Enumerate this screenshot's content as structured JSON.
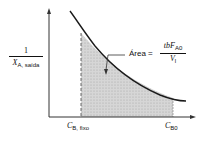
{
  "diagram": {
    "y_axis_label": {
      "numerator": "1",
      "denominator_var": "X",
      "denominator_sub": "A, saída"
    },
    "x_axis_ticks": [
      {
        "var": "C",
        "sub": "B, fixo"
      },
      {
        "var": "C",
        "sub": "B0"
      }
    ],
    "area_annotation": {
      "label": "Área =",
      "numerator_prefix": "tbF",
      "numerator_sub": "A0",
      "denominator_var": "V",
      "denominator_sub": "l"
    },
    "colors": {
      "curve": "#1a1a1a",
      "shading": "#cfcfcf",
      "axes": "#333333"
    }
  }
}
